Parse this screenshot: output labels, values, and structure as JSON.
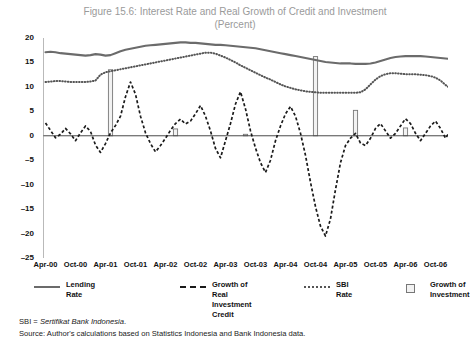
{
  "figure": {
    "title_line1": "Figure 15.6: Interest Rate and Real Growth of Credit and Investment",
    "title_line2": "(Percent)"
  },
  "notes": {
    "sbi_prefix": "SBI = ",
    "sbi_italic": "Sertifikat Bank Indonesia",
    "sbi_suffix": ".",
    "source": "Source: Author's calculations based on Statistics Indonesia and Bank Indonesia data."
  },
  "legend": {
    "items": [
      {
        "label": "Lending Rate",
        "key": "solid-line-key",
        "color": "#6b6b6b"
      },
      {
        "label": "Growth of Real\nInvestment Credit",
        "key": "dashed-line-key",
        "color": "#1a1a1a"
      },
      {
        "label": "SBI Rate",
        "key": "dotted-line-key",
        "color": "#555555"
      },
      {
        "label": "Growth of\nInvestment",
        "key": "bar-swatch-key",
        "color": "#f2f2f2"
      }
    ]
  },
  "chart_data": {
    "type": "line",
    "title": "Figure 15.6: Interest Rate and Real Growth of Credit and Investment (Percent)",
    "xlabel": "",
    "ylabel": "",
    "ylim": [
      -25,
      20
    ],
    "yticks": [
      20,
      15,
      10,
      5,
      0,
      -5,
      -10,
      -15,
      -20,
      -25
    ],
    "grid": false,
    "zero_line": 0,
    "legend_position": "below",
    "xtick_labels": [
      "Apr-00",
      "Oct-00",
      "Apr-01",
      "Oct-01",
      "Apr-02",
      "Oct-02",
      "Apr-03",
      "Oct-03",
      "Apr-04",
      "Oct-04",
      "Apr-05",
      "Oct-05",
      "Apr-06",
      "Oct-06"
    ],
    "xtick_indices": [
      0,
      6,
      12,
      18,
      24,
      30,
      36,
      42,
      48,
      54,
      60,
      66,
      72,
      78
    ],
    "x_months": [
      "Apr-00",
      "May-00",
      "Jun-00",
      "Jul-00",
      "Aug-00",
      "Sep-00",
      "Oct-00",
      "Nov-00",
      "Dec-00",
      "Jan-01",
      "Feb-01",
      "Mar-01",
      "Apr-01",
      "May-01",
      "Jun-01",
      "Jul-01",
      "Aug-01",
      "Sep-01",
      "Oct-01",
      "Nov-01",
      "Dec-01",
      "Jan-02",
      "Feb-02",
      "Mar-02",
      "Apr-02",
      "May-02",
      "Jun-02",
      "Jul-02",
      "Aug-02",
      "Sep-02",
      "Oct-02",
      "Nov-02",
      "Dec-02",
      "Jan-03",
      "Feb-03",
      "Mar-03",
      "Apr-03",
      "May-03",
      "Jun-03",
      "Jul-03",
      "Aug-03",
      "Sep-03",
      "Oct-03",
      "Nov-03",
      "Dec-03",
      "Jan-04",
      "Feb-04",
      "Mar-04",
      "Apr-04",
      "May-04",
      "Jun-04",
      "Jul-04",
      "Aug-04",
      "Sep-04",
      "Oct-04",
      "Nov-04",
      "Dec-04",
      "Jan-05",
      "Feb-05",
      "Mar-05",
      "Apr-05",
      "May-05",
      "Jun-05",
      "Jul-05",
      "Aug-05",
      "Sep-05",
      "Oct-05",
      "Nov-05",
      "Dec-05",
      "Jan-06",
      "Feb-06",
      "Mar-06",
      "Apr-06",
      "May-06",
      "Jun-06",
      "Jul-06",
      "Aug-06",
      "Sep-06",
      "Oct-06",
      "Nov-06",
      "Dec-06"
    ],
    "series": [
      {
        "name": "Lending Rate",
        "style": "solid",
        "color": "#6b6b6b",
        "values": [
          17.1,
          17.2,
          17.1,
          16.9,
          16.8,
          16.7,
          16.6,
          16.5,
          16.4,
          16.5,
          16.7,
          16.6,
          16.4,
          16.5,
          16.9,
          17.3,
          17.6,
          17.8,
          18.0,
          18.2,
          18.4,
          18.5,
          18.6,
          18.7,
          18.8,
          18.9,
          19.0,
          19.1,
          19.1,
          19.0,
          19.0,
          18.9,
          18.8,
          18.7,
          18.6,
          18.6,
          18.5,
          18.4,
          18.3,
          18.2,
          18.1,
          18.0,
          17.9,
          17.7,
          17.5,
          17.3,
          17.1,
          16.9,
          16.7,
          16.5,
          16.3,
          16.1,
          15.9,
          15.7,
          15.5,
          15.3,
          15.1,
          15.0,
          14.9,
          14.8,
          14.8,
          14.8,
          14.7,
          14.7,
          14.7,
          14.8,
          15.0,
          15.3,
          15.6,
          15.9,
          16.1,
          16.2,
          16.3,
          16.3,
          16.3,
          16.3,
          16.2,
          16.1,
          16.0,
          15.9,
          15.8,
          15.7
        ]
      },
      {
        "name": "SBI Rate",
        "style": "dotted",
        "color": "#555555",
        "values": [
          11.0,
          11.1,
          11.2,
          11.2,
          11.1,
          11.0,
          11.0,
          11.0,
          11.0,
          11.1,
          11.3,
          12.5,
          13.0,
          13.2,
          13.4,
          13.6,
          13.8,
          14.0,
          14.2,
          14.4,
          14.6,
          14.8,
          15.0,
          15.2,
          15.4,
          15.6,
          15.8,
          16.0,
          16.2,
          16.4,
          16.6,
          16.8,
          17.0,
          17.0,
          16.8,
          16.4,
          16.0,
          15.5,
          15.0,
          14.4,
          13.9,
          13.4,
          12.9,
          12.4,
          11.9,
          11.5,
          11.0,
          10.5,
          10.1,
          9.8,
          9.5,
          9.3,
          9.1,
          9.0,
          8.9,
          8.8,
          8.8,
          8.8,
          8.8,
          8.8,
          8.8,
          8.8,
          8.8,
          8.9,
          9.5,
          10.5,
          11.5,
          12.2,
          12.6,
          12.8,
          12.8,
          12.7,
          12.6,
          12.6,
          12.6,
          12.5,
          12.4,
          12.2,
          11.9,
          11.3,
          10.4,
          9.7
        ]
      },
      {
        "name": "Growth of Real Investment Credit",
        "style": "dashed",
        "color": "#1a1a1a",
        "values": [
          2.6,
          1.1,
          -0.4,
          0.3,
          1.5,
          0.4,
          -1.0,
          0.6,
          2.0,
          0.9,
          -1.9,
          -3.4,
          -1.6,
          0.6,
          2.1,
          4.0,
          8.0,
          11.0,
          8.5,
          4.0,
          0.6,
          -1.6,
          -3.3,
          -2.0,
          -0.5,
          1.1,
          2.5,
          3.4,
          2.4,
          3.0,
          4.5,
          6.2,
          4.0,
          1.0,
          -2.6,
          -4.5,
          -1.0,
          2.5,
          6.5,
          9.0,
          5.5,
          1.0,
          -2.5,
          -5.5,
          -7.5,
          -5.0,
          -1.0,
          2.0,
          4.5,
          6.0,
          4.0,
          0.5,
          -4.0,
          -9.5,
          -14.5,
          -18.5,
          -20.5,
          -17.0,
          -11.0,
          -5.5,
          -2.0,
          -0.5,
          0.5,
          -1.5,
          -2.0,
          -0.5,
          1.5,
          2.5,
          1.0,
          -0.5,
          0.5,
          2.0,
          3.5,
          2.5,
          0.5,
          -1.0,
          0.5,
          2.0,
          3.0,
          1.5,
          -0.5,
          1.0
        ]
      }
    ],
    "bars": {
      "name": "Growth of Investment",
      "color": "#f2f2f2",
      "edge": "#777777",
      "points": [
        {
          "x_index": 13,
          "value": 13.5
        },
        {
          "x_index": 26,
          "value": 1.4
        },
        {
          "x_index": 40,
          "value": 0.3
        },
        {
          "x_index": 54,
          "value": 16.2
        },
        {
          "x_index": 62,
          "value": 5.2
        },
        {
          "x_index": 72,
          "value": 1.6
        }
      ]
    }
  }
}
